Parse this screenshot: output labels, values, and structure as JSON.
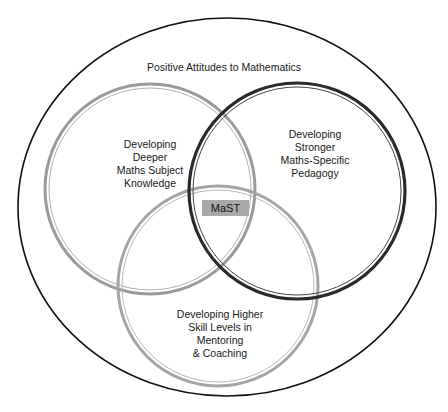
{
  "diagram": {
    "type": "venn",
    "outer_label": "Positive Attitudes to Mathematics",
    "center_label": "MaST",
    "sets": [
      {
        "id": "subject-knowledge",
        "label": "Developing\nDeeper\nMaths Subject\nKnowledge",
        "ring_color": "#9a9a9a"
      },
      {
        "id": "pedagogy",
        "label": "Developing\nStronger\nMaths-Specific\nPedagogy",
        "ring_color": "#2a2a2a"
      },
      {
        "id": "mentoring",
        "label": "Developing Higher\nSkill Levels in\nMentoring\n& Coaching",
        "ring_color": "#a5a5a5"
      }
    ],
    "colors": {
      "outer_ring": "#111111",
      "center_box": "#a9a9a9",
      "background": "#ffffff"
    }
  }
}
